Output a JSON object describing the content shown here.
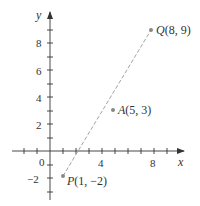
{
  "diagram": {
    "type": "coordinate-plane",
    "axes": {
      "x_label": "x",
      "y_label": "y",
      "origin_label": "0",
      "x_tick_labels": [
        {
          "value": 4,
          "label": "4"
        },
        {
          "value": 8,
          "label": "8"
        }
      ],
      "y_tick_labels": [
        {
          "value": 8,
          "label": "8"
        },
        {
          "value": 6,
          "label": "6"
        },
        {
          "value": 4,
          "label": "4"
        },
        {
          "value": 2,
          "label": "2"
        },
        {
          "value": -2,
          "label": "−2"
        }
      ],
      "x_range": [
        -3,
        10
      ],
      "y_range": [
        -4,
        10
      ]
    },
    "points": [
      {
        "name": "P",
        "x": 1,
        "y": -2,
        "label": "P(1, −2)",
        "letter": "P",
        "coords": "(1, −2)"
      },
      {
        "name": "A",
        "x": 5,
        "y": 3,
        "label": "A(5, 3)",
        "letter": "A",
        "coords": "(5, 3)"
      },
      {
        "name": "Q",
        "x": 8,
        "y": 9,
        "label": "Q(8, 9)",
        "letter": "Q",
        "coords": "(8, 9)"
      }
    ],
    "segment": {
      "from": "P",
      "to": "Q",
      "style": "dashed"
    },
    "colors": {
      "axis": "#333333",
      "point": "#888888",
      "segment": "#999999",
      "text": "#333333"
    }
  }
}
